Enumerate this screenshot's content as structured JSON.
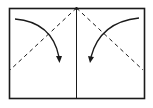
{
  "diagram": {
    "type": "origami-fold-instruction",
    "colors": {
      "stroke": "#1a1a1a",
      "background": "#ffffff"
    },
    "paper": {
      "x": 9,
      "y": 8,
      "width": 135,
      "height": 90
    },
    "center_crease": {
      "x": 76.5
    },
    "valley_folds": [
      {
        "from": [
          76.5,
          8
        ],
        "to": [
          10,
          70
        ]
      },
      {
        "from": [
          76.5,
          8
        ],
        "to": [
          143,
          70
        ]
      }
    ],
    "fold_arrows": [
      {
        "direction": "left-corner-down-right"
      },
      {
        "direction": "right-corner-down-left"
      }
    ]
  }
}
